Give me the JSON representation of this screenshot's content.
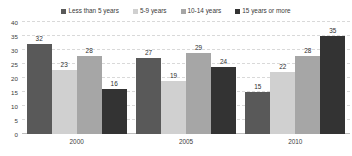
{
  "chart_data": {
    "type": "bar",
    "title": "",
    "xlabel": "",
    "ylabel": "",
    "categories": [
      "2000",
      "2005",
      "2010"
    ],
    "series": [
      {
        "name": "Less than 5 years",
        "color": "#595959",
        "values": [
          32,
          27,
          15
        ]
      },
      {
        "name": "5-9 years",
        "color": "#d0d0d0",
        "values": [
          23,
          19,
          22
        ]
      },
      {
        "name": "10-14 years",
        "color": "#a6a6a6",
        "values": [
          28,
          29,
          28
        ]
      },
      {
        "name": "15 years or more",
        "color": "#333333",
        "values": [
          16,
          24,
          35
        ]
      }
    ],
    "ylim": [
      0,
      40
    ],
    "yticks": [
      0,
      5,
      10,
      15,
      20,
      25,
      30,
      35,
      40
    ],
    "grid": true,
    "legend_position": "top"
  }
}
